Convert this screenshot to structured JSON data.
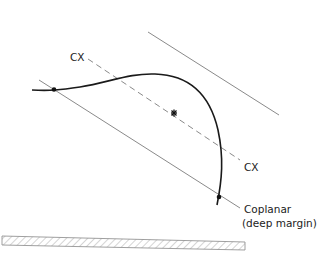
{
  "diagram": {
    "labels": {
      "cx_top": "CX",
      "cx_bottom": "CX",
      "coplanar_line1": "Coplanar",
      "coplanar_line2": "(deep margin)"
    },
    "colors": {
      "curve": "#1a1a1a",
      "lines": "#777777",
      "dashed": "#888888",
      "hatch": "#999999"
    },
    "elements": [
      "upper-parallel-line",
      "lower-parallel-line",
      "cx-dashed-axis",
      "trajectory-curve",
      "start-point",
      "end-point",
      "center-star",
      "hatched-surface"
    ]
  }
}
